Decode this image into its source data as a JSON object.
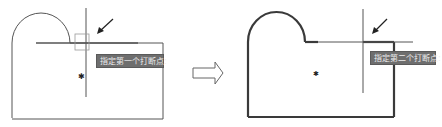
{
  "left_panel": {
    "prompt_text": "指定第一个打断点:",
    "marker": "✱",
    "pick_arrow": "arrow-icon"
  },
  "transition": {
    "icon": "right-arrow-icon"
  },
  "right_panel": {
    "prompt_text": "指定第二个打断点:",
    "marker": "✱",
    "pick_arrow": "arrow-icon"
  },
  "colors": {
    "line": "#555555",
    "thick_line": "#3a3a3a",
    "tooltip_bg": "#6e6e6e",
    "tooltip_text": "#ececec"
  }
}
